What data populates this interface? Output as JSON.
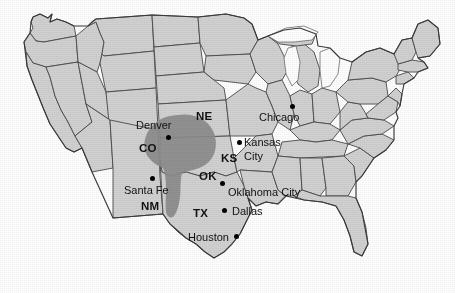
{
  "map": {
    "title": "Tornado Alley map of the contiguous United States",
    "background_color": "#ffffff",
    "land_fill_color": "#d2d2d2",
    "land_border_color": "#4a4a4a",
    "highlight_fill_color": "#8c8c8c",
    "lake_fill_color": "#ffffff",
    "label_color": "#111111"
  },
  "highlight_region": {
    "name": "tornado-alley",
    "label": "",
    "fill": "#8c8c8c",
    "covers_states": [
      "NE",
      "KS",
      "CO",
      "OK",
      "TX",
      "NM"
    ]
  },
  "state_labels": [
    {
      "code": "NE",
      "x": 196,
      "y": 110
    },
    {
      "code": "CO",
      "x": 139,
      "y": 142
    },
    {
      "code": "KS",
      "x": 221,
      "y": 152
    },
    {
      "code": "OK",
      "x": 199,
      "y": 170
    },
    {
      "code": "NM",
      "x": 141,
      "y": 200
    },
    {
      "code": "TX",
      "x": 193,
      "y": 207
    }
  ],
  "cities": [
    {
      "name": "Denver",
      "label_x": 136,
      "label_y": 119,
      "dot_x": 166,
      "dot_y": 135,
      "lines": [
        "Denver"
      ]
    },
    {
      "name": "Santa Fe",
      "label_x": 124,
      "label_y": 184,
      "dot_x": 150,
      "dot_y": 176,
      "lines": [
        "Santa Fe"
      ]
    },
    {
      "name": "Chicago",
      "label_x": 259,
      "label_y": 111,
      "dot_x": 290,
      "dot_y": 106,
      "lines": [
        "Chicago"
      ]
    },
    {
      "name": "Kansas City",
      "label_x": 244,
      "label_y": 139,
      "dot_x": 238,
      "dot_y": 143,
      "lines": [
        "Kansas",
        "City"
      ]
    },
    {
      "name": "Oklahoma City",
      "label_x": 228,
      "label_y": 186,
      "dot_x": 221,
      "dot_y": 181,
      "lines": [
        "Oklahoma City"
      ]
    },
    {
      "name": "Dallas",
      "label_x": 232,
      "label_y": 205,
      "dot_x": 224,
      "dot_y": 209,
      "lines": [
        "Dallas"
      ]
    },
    {
      "name": "Houston",
      "label_x": 188,
      "label_y": 231,
      "dot_x": 235,
      "dot_y": 235,
      "lines": [
        "Houston"
      ]
    }
  ]
}
